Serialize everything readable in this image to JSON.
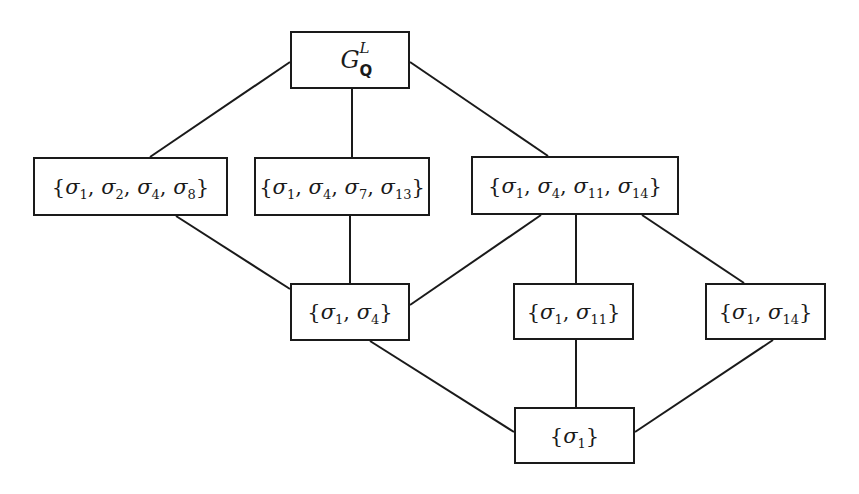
{
  "diagram": {
    "type": "subgroup-lattice",
    "colors": {
      "line": "#1a1a1a",
      "background": "#ffffff"
    },
    "nodes": [
      {
        "id": "top",
        "label": "G_Q^L",
        "base": "G",
        "superscript": "L",
        "subscript": "Q",
        "x": 290,
        "y": 31,
        "w": 120,
        "h": 58
      },
      {
        "id": "s1248",
        "label": "{σ1, σ2, σ4, σ8}",
        "x": 33,
        "y": 157,
        "w": 195,
        "h": 59,
        "elements": [
          "σ1",
          "σ2",
          "σ4",
          "σ8"
        ]
      },
      {
        "id": "s14713",
        "label": "{σ1, σ4, σ7, σ13}",
        "x": 254,
        "y": 157,
        "w": 176,
        "h": 59,
        "elements": [
          "σ1",
          "σ4",
          "σ7",
          "σ13"
        ]
      },
      {
        "id": "s141114",
        "label": "{σ1, σ4, σ11, σ14}",
        "x": 471,
        "y": 156,
        "w": 208,
        "h": 59,
        "elements": [
          "σ1",
          "σ4",
          "σ11",
          "σ14"
        ]
      },
      {
        "id": "s14",
        "label": "{σ1, σ4}",
        "x": 290,
        "y": 283,
        "w": 120,
        "h": 58,
        "elements": [
          "σ1",
          "σ4"
        ]
      },
      {
        "id": "s111",
        "label": "{σ1, σ11}",
        "x": 513,
        "y": 283,
        "w": 121,
        "h": 57,
        "elements": [
          "σ1",
          "σ11"
        ]
      },
      {
        "id": "s114",
        "label": "{σ1, σ14}",
        "x": 705,
        "y": 283,
        "w": 121,
        "h": 57,
        "elements": [
          "σ1",
          "σ14"
        ]
      },
      {
        "id": "s1",
        "label": "{σ1}",
        "x": 514,
        "y": 407,
        "w": 121,
        "h": 57,
        "elements": [
          "σ1"
        ]
      }
    ],
    "edges": [
      {
        "from": "top",
        "to": "s1248",
        "x1": 290,
        "y1": 62,
        "x2": 150,
        "y2": 157
      },
      {
        "from": "top",
        "to": "s14713",
        "x1": 352,
        "y1": 89,
        "x2": 352,
        "y2": 157
      },
      {
        "from": "top",
        "to": "s141114",
        "x1": 410,
        "y1": 62,
        "x2": 548,
        "y2": 156
      },
      {
        "from": "s1248",
        "to": "s14",
        "x1": 176,
        "y1": 216,
        "x2": 290,
        "y2": 289
      },
      {
        "from": "s14713",
        "to": "s14",
        "x1": 350,
        "y1": 216,
        "x2": 350,
        "y2": 283
      },
      {
        "from": "s141114",
        "to": "s14",
        "x1": 541,
        "y1": 215,
        "x2": 410,
        "y2": 305
      },
      {
        "from": "s141114",
        "to": "s111",
        "x1": 576,
        "y1": 215,
        "x2": 576,
        "y2": 283
      },
      {
        "from": "s141114",
        "to": "s114",
        "x1": 642,
        "y1": 215,
        "x2": 744,
        "y2": 283
      },
      {
        "from": "s14",
        "to": "s1",
        "x1": 370,
        "y1": 341,
        "x2": 514,
        "y2": 432
      },
      {
        "from": "s111",
        "to": "s1",
        "x1": 576,
        "y1": 340,
        "x2": 576,
        "y2": 407
      },
      {
        "from": "s114",
        "to": "s1",
        "x1": 773,
        "y1": 340,
        "x2": 635,
        "y2": 432
      }
    ]
  }
}
